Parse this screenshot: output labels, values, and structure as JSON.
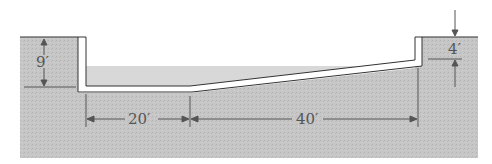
{
  "diagram": {
    "type": "pool-cross-section",
    "labels": {
      "deep_end_depth": "9′",
      "shallow_end_depth": "4′",
      "deep_floor_length": "20′",
      "slope_length": "40′"
    },
    "colors": {
      "ground": "#c4c4c4",
      "water": "#d6d6d6",
      "wall": "#ffffff",
      "line": "#333333",
      "dimension": "#555555"
    }
  }
}
